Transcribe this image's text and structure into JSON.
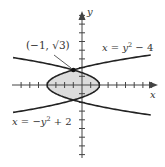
{
  "figure": {
    "type": "region-between-curves",
    "axes": {
      "x_label": "x",
      "y_label": "y"
    },
    "curves": [
      {
        "id": "c1",
        "equation_text": "x = y² − 4",
        "label_parts": {
          "lhs": "x",
          "eq": " = ",
          "var": "y",
          "exp": "2",
          "rest": " − 4"
        },
        "a": 1,
        "b": -4
      },
      {
        "id": "c2",
        "equation_text": "x = −y² + 2",
        "label_parts": {
          "lhs": "x",
          "eq": " = −",
          "var": "y",
          "exp": "2",
          "rest": " + 2"
        },
        "a": -1,
        "b": 2
      }
    ],
    "intersection_point": {
      "label": "(−1, √3)",
      "x": -1,
      "y": 1.732
    },
    "shaded_region": {
      "fill": "#dcdcdc",
      "between": [
        "c1",
        "c2"
      ],
      "y_range": [
        -1.732,
        1.732
      ]
    },
    "colors": {
      "curve": "#222222",
      "axis": "#444444",
      "region": "#dcdcdc",
      "text": "#333333"
    },
    "view": {
      "origin_px": [
        82,
        85
      ],
      "unit_px": 8.7,
      "x_ticks": [
        -7,
        -6,
        -5,
        -4,
        -3,
        -2,
        -1,
        1,
        2,
        3,
        4,
        5,
        6,
        7,
        8
      ],
      "y_ticks": [
        -8,
        -7,
        -6,
        -5,
        -4,
        -3,
        -2,
        -1,
        1,
        2,
        3,
        4,
        5,
        6,
        7,
        8
      ]
    }
  }
}
